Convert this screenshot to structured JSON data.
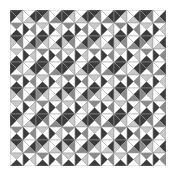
{
  "caption": "",
  "grid": {
    "rows": 12,
    "cols": 12,
    "cell_size": 13,
    "line_color": "#9a9a9a",
    "shades": {
      "white": "#ffffff",
      "light": "#c8c8c8",
      "mid": "#8a8a8a",
      "dark": "#3c3c3c"
    },
    "pattern_note": "each cell is split by both diagonals into 4 triangles: top, right, bottom, left",
    "cells": [
      [
        "dlwd",
        "wdlw",
        "dmwd",
        "wdmw",
        "dlwd",
        "wdlw",
        "dmwd",
        "wdmw",
        "dlwd",
        "wdlw",
        "dmwd",
        "wdmw"
      ],
      [
        "mwdw",
        "wmwd",
        "lwdw",
        "wlwd",
        "mwdw",
        "wmwd",
        "lwdw",
        "wlwd",
        "mwdw",
        "wmwd",
        "lwdw",
        "wlwd"
      ],
      [
        "dmwl",
        "wdmw",
        "dlwm",
        "wdlw",
        "dmwl",
        "wdmw",
        "dlwm",
        "wdlw",
        "dmwl",
        "wdmw",
        "dlwm",
        "wdlw"
      ],
      [
        "lwdw",
        "wlwd",
        "mwdw",
        "wmwd",
        "lwdw",
        "wlwd",
        "mwdw",
        "wmwd",
        "lwdw",
        "wlwd",
        "mwdw",
        "wmwd"
      ],
      [
        "dlwd",
        "wdlw",
        "dmwd",
        "wdmw",
        "dlwd",
        "wdlw",
        "dmwd",
        "wdmw",
        "dlwd",
        "wdlw",
        "dmwd",
        "wdmw"
      ],
      [
        "mwdw",
        "wmwd",
        "lwdw",
        "wlwd",
        "mwdw",
        "wmwd",
        "lwdw",
        "wlwd",
        "mwdw",
        "wmwd",
        "lwdw",
        "wlwd"
      ],
      [
        "dmwl",
        "wdmw",
        "dlwm",
        "wdlw",
        "dmwl",
        "wdmw",
        "dlwm",
        "wdlw",
        "dmwl",
        "wdmw",
        "dlwm",
        "wdlw"
      ],
      [
        "lwdw",
        "wlwd",
        "mwdw",
        "wmwd",
        "lwdw",
        "wlwd",
        "mwdw",
        "wmwd",
        "lwdw",
        "wlwd",
        "mwdw",
        "wmwd"
      ],
      [
        "dlwd",
        "wdlw",
        "dmwd",
        "wdmw",
        "dlwd",
        "wdlw",
        "dmwd",
        "wdmw",
        "dlwd",
        "wdlw",
        "dmwd",
        "wdmw"
      ],
      [
        "mwdw",
        "wmwd",
        "lwdw",
        "wlwd",
        "mwdw",
        "wmwd",
        "lwdw",
        "wlwd",
        "mwdw",
        "wmwd",
        "lwdw",
        "wlwd"
      ],
      [
        "dmwl",
        "wdmw",
        "dlwm",
        "wdlw",
        "dmwl",
        "wdmw",
        "dlwm",
        "wdlw",
        "dmwl",
        "wdmw",
        "dlwm",
        "wdlw"
      ],
      [
        "lwdw",
        "wlwd",
        "mwdw",
        "wmwd",
        "lwdw",
        "wlwd",
        "mwdw",
        "wmwd",
        "lwdw",
        "wlwd",
        "mwdw",
        "wmwd"
      ]
    ]
  }
}
